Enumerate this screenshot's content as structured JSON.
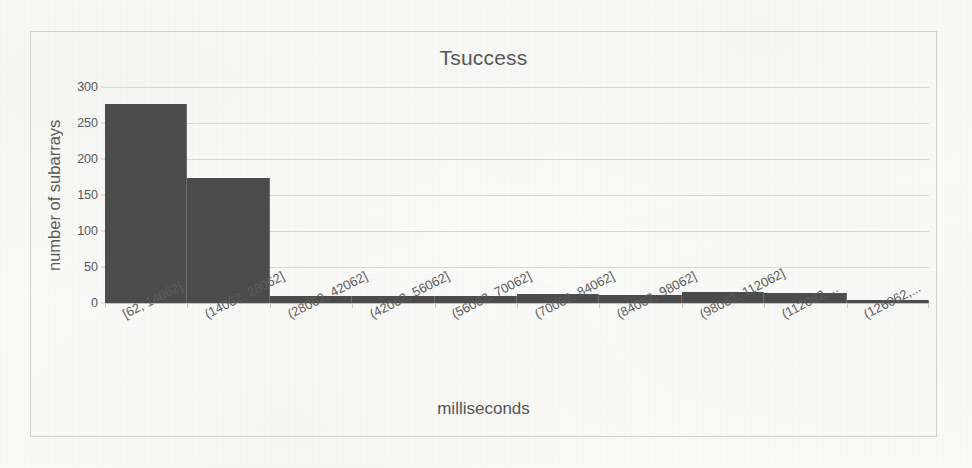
{
  "chart_data": {
    "type": "bar",
    "title": "Tsuccess",
    "xlabel": "milliseconds",
    "ylabel": "number of subarrays",
    "categories": [
      "[62, 14062]",
      "(14062, 28062]",
      "(28062, 42062]",
      "(42062, 56062]",
      "(56062, 70062]",
      "(70062, 84062]",
      "(84062, 98062]",
      "(98062, 112062]",
      "(112062,...",
      "(126062,..."
    ],
    "values": [
      277,
      173,
      10,
      10,
      10,
      12,
      11,
      15,
      14,
      4
    ],
    "ylim": [
      0,
      300
    ],
    "yticks": [
      0,
      50,
      100,
      150,
      200,
      250,
      300
    ],
    "ytick_labels": [
      "0",
      "50",
      "100",
      "150",
      "200",
      "250",
      "300"
    ],
    "grid": true,
    "legend": "none",
    "bar_color": "#4c4c4c",
    "gridline_color": "#d8d8d6",
    "text_color": "#575757"
  }
}
